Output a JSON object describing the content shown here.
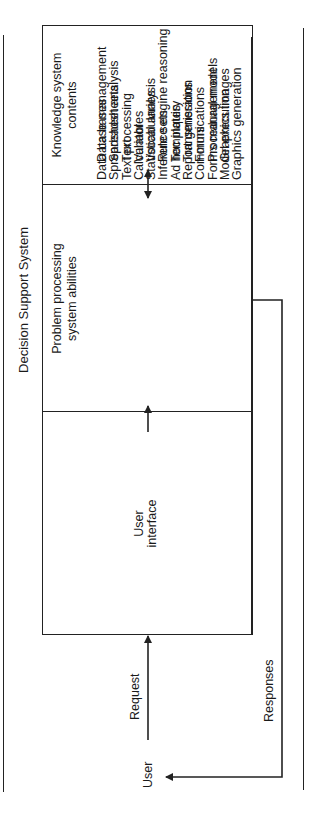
{
  "diagram": {
    "title": "Decision Support System",
    "user_label": "User",
    "request_label": "Request",
    "responses_label": "Responses",
    "boxes": [
      {
        "heading": "User interface",
        "heading_lines": [
          "User",
          "interface"
        ],
        "items": []
      },
      {
        "heading": "Problem processing system abilities",
        "heading_lines": [
          "Problem processing",
          "system abilities"
        ],
        "items": [
          "Data base management",
          "Spreadsheet analysis",
          "Text processing",
          "Calculator",
          "Statistical analysis",
          "Inference engine reasoning",
          "Ad hoc inquiry",
          "Report generation",
          "Communications",
          "Forms management",
          "Model execution",
          "Graphics generation"
        ]
      },
      {
        "heading": "Knowledge system contents",
        "heading_lines": [
          "Knowledge system",
          "contents"
        ],
        "items": [
          "Data bases",
          "Spreadsheets",
          "Text",
          "Variables",
          "Vocabularies",
          "Rule sets",
          "Templates",
          "Transmissions",
          "Forms",
          "Procedural models",
          "Graphics images"
        ]
      }
    ],
    "connections": [
      {
        "from": "User",
        "to": "User interface",
        "label": "Request",
        "direction": "one-way"
      },
      {
        "from": "User interface",
        "to": "Problem processing system abilities",
        "direction": "one-way"
      },
      {
        "from": "Problem processing system abilities",
        "to": "Knowledge system contents",
        "direction": "two-way"
      },
      {
        "from": "Problem processing system abilities",
        "to": "User",
        "label": "Responses",
        "direction": "one-way"
      }
    ]
  }
}
